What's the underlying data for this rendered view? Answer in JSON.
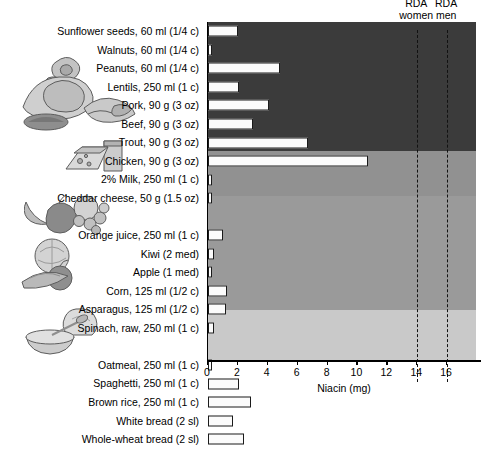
{
  "chart_data": {
    "type": "bar",
    "orientation": "horizontal",
    "title": "",
    "xlabel": "Niacin (mg)",
    "ylabel": "",
    "xlim": [
      0,
      18
    ],
    "ticks": [
      0,
      2,
      4,
      6,
      8,
      10,
      12,
      14,
      16
    ],
    "grid": false,
    "legend": "none",
    "categories": [
      "Sunflower seeds, 60 ml (1/4 c)",
      "Walnuts, 60 ml (1/4 c)",
      "Peanuts, 60 ml (1/4 c)",
      "Lentils, 250 ml (1 c)",
      "Pork, 90 g (3 oz)",
      "Beef, 90 g (3 oz)",
      "Trout, 90 g (3 oz)",
      "Chicken, 90 g (3 oz)",
      "2% Milk, 250 ml (1 c)",
      "Cheddar cheese, 50 g (1.5 oz)",
      "Orange juice, 250 ml (1 c)",
      "Kiwi (2 med)",
      "Apple (1 med)",
      "Corn, 125 ml (1/2 c)",
      "Asparagus, 125 ml (1/2 c)",
      "Spinach, raw, 250 ml (1 c)",
      "Oatmeal, 250 ml (1 c)",
      "Spaghetti, 250 ml (1 c)",
      "Brown rice, 250 ml (1 c)",
      "White bread (2 sl)",
      "Whole-wheat bread (2 sl)"
    ],
    "values": [
      2.0,
      0.3,
      4.8,
      2.1,
      4.1,
      3.0,
      6.7,
      10.7,
      0.2,
      0.1,
      1.0,
      0.4,
      0.2,
      1.3,
      1.2,
      0.4,
      0.3,
      2.1,
      2.9,
      1.7,
      2.4
    ],
    "annotations": [
      {
        "label": "RDA women",
        "value": 14
      },
      {
        "label": "RDA men",
        "value": 16
      }
    ],
    "groups": [
      {
        "name": "protein-foods",
        "rows": 8,
        "band_color": "#3b3b3b"
      },
      {
        "name": "milk-products",
        "rows": 2,
        "band_color": "#919191"
      },
      {
        "name": "vegetables-and-fruit",
        "rows": 6,
        "band_color": "#9a9a9a"
      },
      {
        "name": "grain-products",
        "rows": 5,
        "band_color": "#c9c9c9"
      }
    ]
  },
  "axis": {
    "title": "Niacin (mg)",
    "tick_labels": [
      "0",
      "2",
      "4",
      "6",
      "8",
      "10",
      "12",
      "14",
      "16"
    ]
  },
  "rda": {
    "women_line1": "RDA",
    "women_line2": "women",
    "men_line1": "RDA",
    "men_line2": "men"
  },
  "artwork": {
    "nuts_meat_fish": "protein-foods-illustration",
    "cheese_milk": "dairy-illustration",
    "fruit": "fruit-illustration",
    "vegetables": "vegetables-illustration",
    "bread_cereal": "grain-illustration"
  }
}
